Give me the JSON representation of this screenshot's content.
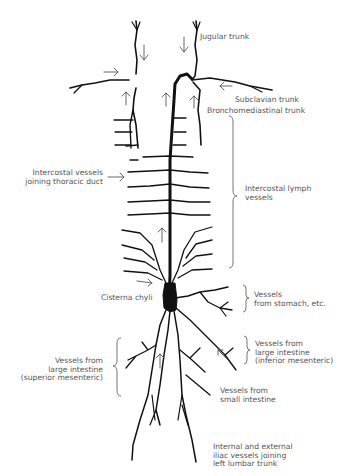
{
  "diagram": {
    "labels": {
      "jugular_trunk": "Jugular trunk",
      "subclavian_trunk": "Subclavian trunk",
      "bronchomediastinal_trunk": "Bronchomediastinal trunk",
      "intercostal_joining": "Intercostal vessels\njoining thoracic duct",
      "intercostal_lymph": "Intercostal lymph\nvessels",
      "cisterna_chyli": "Cisterna chyli",
      "vessels_stomach": "Vessels\nfrom stomach, etc.",
      "large_intestine_inferior": "Vessels from\nlarge intestine\n(inferior mesenteric)",
      "large_intestine_superior": "Vessels from\nlarge intestine\n(superior mesenteric)",
      "small_intestine": "Vessels from\nsmall intestine",
      "iliac_vessels": "Internal and external\niliac vessels joining\nleft lumbar trunk"
    },
    "colors": {
      "ink": "#111111",
      "label": "#555555",
      "background": "#ffffff"
    }
  }
}
